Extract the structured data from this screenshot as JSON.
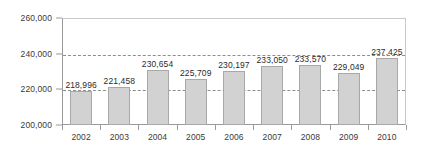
{
  "chart_data": {
    "type": "bar",
    "title": "",
    "subtitle": "",
    "xlabel": "",
    "ylabel": "",
    "categories": [
      "2002",
      "2003",
      "2004",
      "2005",
      "2006",
      "2007",
      "2008",
      "2009",
      "2010"
    ],
    "values": [
      218996,
      221458,
      230654,
      225709,
      230197,
      233050,
      233570,
      229049,
      237425
    ],
    "value_labels": [
      "218,996",
      "221,458",
      "230,654",
      "225,709",
      "230,197",
      "233,050",
      "233,570",
      "229,049",
      "237,425"
    ],
    "ylim": [
      200000,
      260000
    ],
    "y_ticks": [
      200000,
      220000,
      240000,
      260000
    ],
    "y_tick_labels": [
      "200,000",
      "220,000",
      "240,000",
      "260,000"
    ],
    "gridlines": [
      220000,
      240000
    ],
    "grid": true,
    "legend": null,
    "legend_position": "none",
    "series": [
      {
        "name": "",
        "values": [
          218996,
          221458,
          230654,
          225709,
          230197,
          233050,
          233570,
          229049,
          237425
        ]
      }
    ],
    "colors": {
      "bar_fill": "#d2d2d2",
      "bar_border": "#a8a8a8",
      "gridline": "#8d8d8d",
      "axis": "#9a9a9a",
      "text": "#3a3a3a",
      "background": "#ffffff"
    }
  }
}
